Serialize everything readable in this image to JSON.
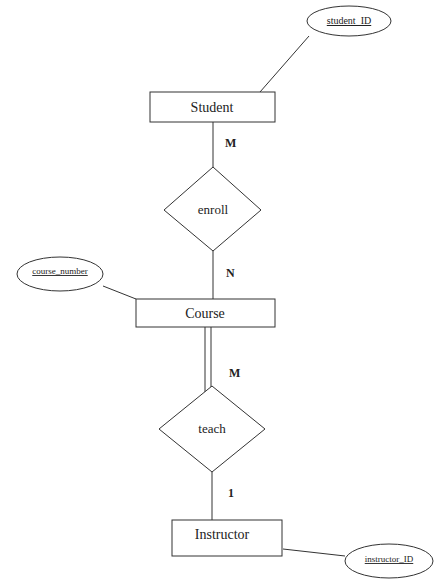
{
  "diagram": {
    "type": "ER diagram",
    "entities": [
      {
        "name": "Student"
      },
      {
        "name": "Course"
      },
      {
        "name": "Instructor"
      }
    ],
    "relationships": [
      {
        "name": "enroll"
      },
      {
        "name": "teach"
      }
    ],
    "attributes": [
      {
        "name": "student_ID"
      },
      {
        "name": "course_number"
      },
      {
        "name": "instructor_ID"
      }
    ],
    "cardinalities": {
      "student_enroll": "M",
      "enroll_course": "N",
      "course_teach": "M",
      "teach_instructor": "1"
    }
  }
}
